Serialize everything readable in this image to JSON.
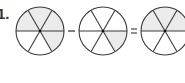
{
  "problem": {
    "label": "1.",
    "operators": [
      "-",
      "="
    ]
  },
  "colors": {
    "stroke": "#3a3a3a",
    "shade": "#ebebeb",
    "unshaded": "#ffffff",
    "operator": "#555555"
  },
  "circles": [
    {
      "name": "minuend-circle",
      "cx": 40,
      "cy": 31,
      "r": 24,
      "sectors": 6,
      "shaded": [
        "upper-left",
        "top",
        "upper-right",
        "lower-right"
      ],
      "fraction": "4/6"
    },
    {
      "name": "subtrahend-circle",
      "cx": 103,
      "cy": 31,
      "r": 24,
      "sectors": 6,
      "shaded": [
        "lower-right"
      ],
      "fraction": "1/6"
    },
    {
      "name": "difference-circle",
      "cx": 165,
      "cy": 31,
      "r": 24,
      "sectors": 6,
      "shaded": [
        "upper-left",
        "top",
        "upper-right"
      ],
      "fraction": "3/6"
    }
  ]
}
